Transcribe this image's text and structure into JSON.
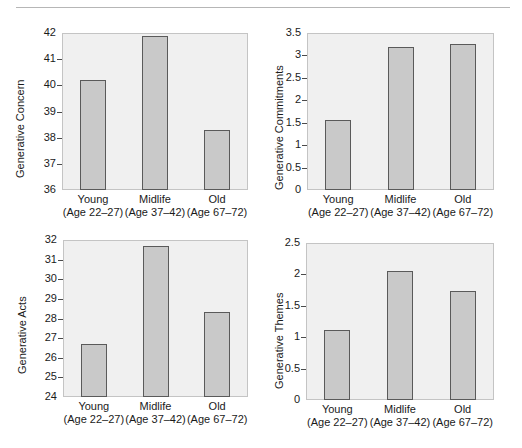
{
  "figure": {
    "layout": "2x2-panel",
    "background": "#ffffff",
    "bar_fill": "#c9c9c9",
    "bar_edge": "#5a5a5a",
    "plot_background": "#f0f0f0",
    "plot_border": "#c4c4c4",
    "rule_color": "#b6b6b6"
  },
  "categories": [
    "Young",
    "Midlife",
    "Old"
  ],
  "category_sublabels": [
    "(Age 22–27)",
    "(Age 37–42)",
    "(Age 67–72)"
  ],
  "chart_data": [
    {
      "id": "generative-concern",
      "type": "bar",
      "title": "",
      "xlabel": "",
      "ylabel": "Generative Concern",
      "categories": [
        "Young",
        "Midlife",
        "Old"
      ],
      "category_sublabels": [
        "(Age 22–27)",
        "(Age 37–42)",
        "(Age 67–72)"
      ],
      "values": [
        40.2,
        41.9,
        38.3
      ],
      "ylim": [
        36,
        42
      ],
      "yticks": [
        36,
        37,
        38,
        39,
        40,
        41,
        42
      ],
      "ytick_labels": [
        "36",
        "37",
        "38",
        "39",
        "40",
        "41",
        "42"
      ],
      "grid": false,
      "legend": "none"
    },
    {
      "id": "generative-commitments",
      "type": "bar",
      "title": "",
      "xlabel": "",
      "ylabel": "Generative Commitments",
      "categories": [
        "Young",
        "Midlife",
        "Old"
      ],
      "category_sublabels": [
        "(Age 22–27)",
        "(Age 37–42)",
        "(Age 67–72)"
      ],
      "values": [
        1.56,
        3.19,
        3.26
      ],
      "ylim": [
        0,
        3.5
      ],
      "yticks": [
        0,
        0.5,
        1,
        1.5,
        2,
        2.5,
        3,
        3.5
      ],
      "ytick_labels": [
        "0",
        "0.5",
        "1",
        "1.5",
        "2",
        "2.5",
        "3",
        "3.5"
      ],
      "grid": false,
      "legend": "none"
    },
    {
      "id": "generative-acts",
      "type": "bar",
      "title": "",
      "xlabel": "",
      "ylabel": "Generative Acts",
      "categories": [
        "Young",
        "Midlife",
        "Old"
      ],
      "category_sublabels": [
        "(Age 22–27)",
        "(Age 37–42)",
        "(Age 67–72)"
      ],
      "values": [
        26.7,
        31.7,
        28.35
      ],
      "ylim": [
        24,
        32
      ],
      "yticks": [
        24,
        25,
        26,
        27,
        28,
        29,
        30,
        31,
        32
      ],
      "ytick_labels": [
        "24",
        "25",
        "26",
        "27",
        "28",
        "29",
        "30",
        "31",
        "32"
      ],
      "grid": false,
      "legend": "none"
    },
    {
      "id": "generative-themes",
      "type": "bar",
      "title": "",
      "xlabel": "",
      "ylabel": "Generative Themes",
      "categories": [
        "Young",
        "Midlife",
        "Old"
      ],
      "category_sublabels": [
        "(Age 22–27)",
        "(Age 37–42)",
        "(Age 67–72)"
      ],
      "values": [
        1.12,
        2.06,
        1.74
      ],
      "ylim": [
        0,
        2.5
      ],
      "yticks": [
        0,
        0.5,
        1,
        1.5,
        2,
        2.5
      ],
      "ytick_labels": [
        "0",
        "0.5",
        "1",
        "1.5",
        "2",
        "2.5"
      ],
      "grid": false,
      "legend": "none"
    }
  ]
}
